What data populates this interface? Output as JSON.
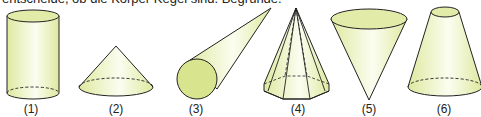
{
  "instruction": "entscheide, ob die Körper Kegel sind. Begründe.",
  "figures": [
    {
      "label": "(1)",
      "shape": "cylinder"
    },
    {
      "label": "(2)",
      "shape": "cone"
    },
    {
      "label": "(3)",
      "shape": "cone-lying"
    },
    {
      "label": "(4)",
      "shape": "octagonal-pyramid"
    },
    {
      "label": "(5)",
      "shape": "inverted-cone"
    },
    {
      "label": "(6)",
      "shape": "truncated-cone"
    }
  ],
  "colors": {
    "fill": "#e9f0b8",
    "fill_dark": "#d6e28a",
    "stroke": "#222222"
  }
}
